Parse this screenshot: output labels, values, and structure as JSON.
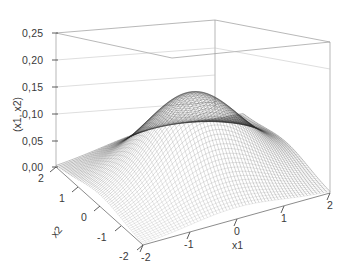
{
  "figure": {
    "kind": "3d-surface-plot",
    "background_color": "#ffffff",
    "line_color": "#2b2b2b",
    "box_color": "#8a8a8a",
    "grid_color": "#b5b5b5"
  },
  "chart_data": {
    "type": "surface",
    "title": "",
    "subtitle": "",
    "xlabel": "x1",
    "ylabel": "x2",
    "zlabel": "f(x1, x2)",
    "zlabel_visible_text": "(x1, x2)",
    "grid": true,
    "legend": "none",
    "projection": "3d-mesh-wireframe",
    "colormap": "grayscale",
    "xlim": [
      -2,
      2
    ],
    "ylim": [
      -2,
      2
    ],
    "zlim": [
      0.0,
      0.25
    ],
    "xticks": [
      -2,
      -1,
      0,
      1,
      2
    ],
    "xtick_labels": [
      "-2",
      "-1",
      "0",
      "1",
      "2"
    ],
    "yticks": [
      -2,
      -1,
      0,
      1,
      2
    ],
    "ytick_labels": [
      "-2",
      "-1",
      "0",
      "1",
      "2"
    ],
    "zticks": [
      0.0,
      0.05,
      0.1,
      0.15,
      0.2,
      0.25
    ],
    "ztick_labels": [
      "0,00",
      "0,05",
      "0,10",
      "0,15",
      "0,20",
      "0,25"
    ],
    "decimal_separator": ",",
    "function": "bivariate standard normal density  f(x1,x2) = (1/(2*pi)) * exp(-(x1^2 + x2^2)/2)",
    "peak_value": 0.2593,
    "peak_location": [
      0,
      0
    ],
    "surface_samples": {
      "x": [
        -2,
        -1.5,
        -1,
        -0.5,
        0,
        0.5,
        1,
        1.5,
        2
      ],
      "y": [
        -2,
        -1.5,
        -1,
        -0.5,
        0,
        0.5,
        1,
        1.5,
        2
      ],
      "z": [
        [
          0.0029,
          0.0076,
          0.0146,
          0.0205,
          0.0215,
          0.0205,
          0.0146,
          0.0076,
          0.0029
        ],
        [
          0.0076,
          0.02,
          0.0384,
          0.0538,
          0.0565,
          0.0538,
          0.0384,
          0.02,
          0.0076
        ],
        [
          0.0146,
          0.0384,
          0.0733,
          0.1028,
          0.108,
          0.1028,
          0.0733,
          0.0384,
          0.0146
        ],
        [
          0.0205,
          0.0538,
          0.1028,
          0.144,
          0.1513,
          0.144,
          0.1028,
          0.0538,
          0.0205
        ],
        [
          0.0215,
          0.0565,
          0.108,
          0.1513,
          0.1592,
          0.1513,
          0.108,
          0.0565,
          0.0215
        ],
        [
          0.0205,
          0.0538,
          0.1028,
          0.144,
          0.1513,
          0.144,
          0.1028,
          0.0538,
          0.0205
        ],
        [
          0.0146,
          0.0384,
          0.0733,
          0.1028,
          0.108,
          0.1028,
          0.0733,
          0.0384,
          0.0146
        ],
        [
          0.0076,
          0.02,
          0.0384,
          0.0538,
          0.0565,
          0.0538,
          0.0384,
          0.02,
          0.0076
        ],
        [
          0.0029,
          0.0076,
          0.0146,
          0.0205,
          0.0215,
          0.0205,
          0.0146,
          0.0076,
          0.0029
        ]
      ]
    },
    "view": {
      "azimuth": -55,
      "elevation": 22
    }
  },
  "axes": {
    "z": {
      "title": "(x1, x2)",
      "ticks": [
        {
          "label": "0,25"
        },
        {
          "label": "0,20"
        },
        {
          "label": "0,15"
        },
        {
          "label": "0,10"
        },
        {
          "label": "0,05"
        },
        {
          "label": "0,00"
        }
      ]
    },
    "x2": {
      "title": "x2",
      "ticks": [
        {
          "label": "2"
        },
        {
          "label": "1"
        },
        {
          "label": "0"
        },
        {
          "label": "-1"
        },
        {
          "label": "-2"
        }
      ]
    },
    "x1": {
      "title": "x1",
      "ticks": [
        {
          "label": "-2"
        },
        {
          "label": "-1"
        },
        {
          "label": "0"
        },
        {
          "label": "1"
        },
        {
          "label": "2"
        }
      ]
    }
  }
}
